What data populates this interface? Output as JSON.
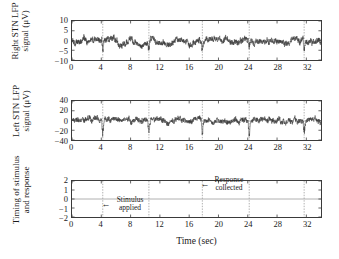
{
  "chart_data": [
    {
      "type": "line",
      "panel_id": "right-stn-lfp",
      "title": "",
      "xlabel": "",
      "ylabel": "Right STN LFP signal (μV)",
      "ylabel_line1": "Right STN LFP",
      "ylabel_line2": "signal (μV)",
      "xlim": [
        0,
        34
      ],
      "ylim": [
        -10,
        10
      ],
      "xticks": [
        0,
        4,
        8,
        12,
        16,
        20,
        24,
        28,
        32
      ],
      "xticklabels": [
        "0",
        "4",
        "8",
        "12",
        "16",
        "20",
        "24",
        "28",
        "32"
      ],
      "yticks": [
        10,
        5,
        0,
        -5,
        -10
      ],
      "yticklabels": [
        "10",
        "5",
        "0",
        "-5",
        "-10"
      ],
      "grid": false,
      "event_lines": [
        4.2,
        10.5,
        17.8,
        24.2,
        31.7
      ],
      "series_name": "Right STN LFP",
      "series_color": "#3b3b3b",
      "units": "μV"
    },
    {
      "type": "line",
      "panel_id": "left-stn-lfp",
      "title": "",
      "xlabel": "",
      "ylabel": "Left STN LFP signal (μV)",
      "ylabel_line1": "Left STN LFP",
      "ylabel_line2": "signal (μV)",
      "xlim": [
        0,
        34
      ],
      "ylim": [
        -40,
        40
      ],
      "xticks": [
        0,
        4,
        8,
        12,
        16,
        20,
        24,
        28,
        32
      ],
      "xticklabels": [
        "0",
        "4",
        "8",
        "12",
        "16",
        "20",
        "24",
        "28",
        "32"
      ],
      "yticks": [
        40,
        20,
        0,
        -20,
        -40
      ],
      "yticklabels": [
        "40",
        "20",
        "0",
        "-20",
        "-40"
      ],
      "grid": false,
      "event_lines": [
        4.2,
        10.5,
        17.8,
        24.2,
        31.7
      ],
      "series_name": "Left STN LFP",
      "series_color": "#3b3b3b",
      "units": "μV"
    },
    {
      "type": "line",
      "panel_id": "timing-stimulus-response",
      "title": "",
      "xlabel": "Time (sec)",
      "ylabel": "Timing of stimulus and response",
      "ylabel_line1": "Timing of stimulus",
      "ylabel_line2": "and response",
      "xlim": [
        0,
        34
      ],
      "ylim": [
        -2,
        2
      ],
      "xticks": [
        0,
        4,
        8,
        12,
        16,
        20,
        24,
        28,
        32
      ],
      "xticklabels": [
        "0",
        "4",
        "8",
        "12",
        "16",
        "20",
        "24",
        "28",
        "32"
      ],
      "yticks": [
        2,
        1,
        0,
        -1,
        -2
      ],
      "yticklabels": [
        "2",
        "1",
        "0",
        "-1",
        "-2"
      ],
      "grid": false,
      "event_lines": [
        4.2,
        10.5,
        17.8,
        24.2,
        31.7
      ],
      "zero_line": 0,
      "annotations": [
        {
          "id": "stimulus-applied",
          "line1": "Stimulus",
          "line2": "applied",
          "arrow": "←",
          "points_to_x": 4.2,
          "text_x": 8.0,
          "text_y": -1.1
        },
        {
          "id": "response-collected",
          "line1": "Response",
          "line2": "collected",
          "arrow": "←",
          "points_to_x": 17.8,
          "text_x": 21.4,
          "text_y": 1.05
        }
      ]
    }
  ],
  "axis_color": "#3a3a3a",
  "event_line_color": "#9a9a9a",
  "background": "#ffffff"
}
